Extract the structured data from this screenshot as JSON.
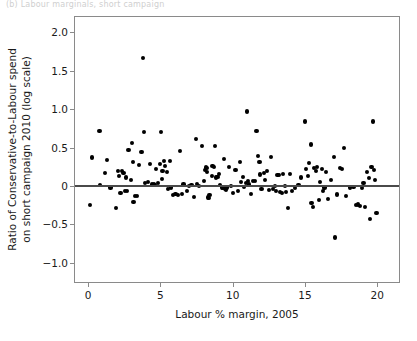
{
  "figure": {
    "top_strip_text": "(b) Labour marginals, short campaign",
    "background": "#ffffff",
    "point_color": "#000000",
    "axis_color": "#8a8a8a",
    "reference_line_color": "#4a4a4a"
  },
  "chart_data": {
    "type": "scatter",
    "title": "",
    "xlabel": "Labour % margin, 2005",
    "ylabel": "Ratio of Conservative-to-Labour spend on short campaign 2010 (log scale)",
    "ylabel_line1": "Ratio of Conservative-to-Labour spend",
    "ylabel_line2": "on short campaign 2010 (log scale)",
    "xlim": [
      -0.9,
      21.5
    ],
    "ylim": [
      -1.25,
      2.2
    ],
    "xticks": [
      0,
      5,
      10,
      15,
      20
    ],
    "xticklabels": [
      "0",
      "5",
      "10",
      "15",
      "20"
    ],
    "yticks": [
      2.0,
      1.5,
      1.0,
      0.5,
      0,
      -0.5,
      -1.0
    ],
    "yticklabels": [
      "2.0",
      "1.5",
      "1.0",
      "0.5",
      "0",
      "−0.5",
      "−1.0"
    ],
    "grid": false,
    "legend": null,
    "reference_lines": [
      {
        "axis": "y",
        "value": 0
      }
    ],
    "marker": "circle",
    "n_points": 163,
    "points": [
      [
        0.15,
        -0.25
      ],
      [
        0.25,
        0.37
      ],
      [
        0.8,
        0.72
      ],
      [
        0.85,
        0.01
      ],
      [
        1.15,
        0.17
      ],
      [
        1.3,
        0.34
      ],
      [
        1.55,
        -0.02
      ],
      [
        1.95,
        -0.29
      ],
      [
        2.05,
        0.19
      ],
      [
        2.15,
        0.13
      ],
      [
        2.25,
        -0.09
      ],
      [
        2.35,
        0.2
      ],
      [
        2.45,
        0.17
      ],
      [
        2.55,
        -0.07
      ],
      [
        2.6,
        0.11
      ],
      [
        2.7,
        -0.06
      ],
      [
        2.8,
        0.47
      ],
      [
        2.95,
        0.08
      ],
      [
        3.05,
        0.56
      ],
      [
        3.1,
        0.31
      ],
      [
        3.15,
        -0.21
      ],
      [
        3.25,
        -0.13
      ],
      [
        3.4,
        -0.13
      ],
      [
        3.5,
        0.27
      ],
      [
        3.7,
        0.44
      ],
      [
        3.8,
        1.67
      ],
      [
        3.85,
        0.7
      ],
      [
        3.95,
        0.04
      ],
      [
        4.15,
        0.05
      ],
      [
        4.3,
        0.29
      ],
      [
        4.4,
        0.02
      ],
      [
        4.55,
        0.03
      ],
      [
        4.65,
        0.01
      ],
      [
        4.7,
        0.22
      ],
      [
        4.85,
        0.04
      ],
      [
        4.95,
        0.29
      ],
      [
        5.05,
        0.7
      ],
      [
        5.1,
        0.09
      ],
      [
        5.15,
        0.19
      ],
      [
        5.25,
        0.33
      ],
      [
        5.35,
        0.26
      ],
      [
        5.45,
        0.18
      ],
      [
        5.55,
        -0.04
      ],
      [
        5.65,
        0.32
      ],
      [
        5.75,
        -0.02
      ],
      [
        5.85,
        -0.12
      ],
      [
        6.05,
        -0.1
      ],
      [
        6.2,
        -0.12
      ],
      [
        6.35,
        0.46
      ],
      [
        6.5,
        -0.1
      ],
      [
        6.6,
        0.02
      ],
      [
        6.85,
        -0.06
      ],
      [
        7.0,
        0.0
      ],
      [
        7.15,
        0.01
      ],
      [
        7.3,
        -0.14
      ],
      [
        7.45,
        0.61
      ],
      [
        7.55,
        0.03
      ],
      [
        7.7,
        0.0
      ],
      [
        7.9,
        0.52
      ],
      [
        8.0,
        0.07
      ],
      [
        8.1,
        0.21
      ],
      [
        8.15,
        0.24
      ],
      [
        8.2,
        0.23
      ],
      [
        8.25,
        0.18
      ],
      [
        8.3,
        -0.15
      ],
      [
        8.35,
        -0.16
      ],
      [
        8.4,
        -0.12
      ],
      [
        8.55,
        0.13
      ],
      [
        8.6,
        0.26
      ],
      [
        8.7,
        0.25
      ],
      [
        8.8,
        0.52
      ],
      [
        8.85,
        0.11
      ],
      [
        8.95,
        0.12
      ],
      [
        9.05,
        0.16
      ],
      [
        9.15,
        0.01
      ],
      [
        9.25,
        -0.02
      ],
      [
        9.35,
        -0.03
      ],
      [
        9.4,
        0.35
      ],
      [
        9.45,
        -0.04
      ],
      [
        9.5,
        -0.01
      ],
      [
        9.55,
        -0.05
      ],
      [
        9.6,
        -0.02
      ],
      [
        9.75,
        0.25
      ],
      [
        9.9,
        0.0
      ],
      [
        10.05,
        -0.09
      ],
      [
        10.2,
        0.21
      ],
      [
        10.35,
        -0.07
      ],
      [
        10.5,
        0.31
      ],
      [
        10.6,
        0.05
      ],
      [
        10.7,
        0.12
      ],
      [
        10.8,
        -0.01
      ],
      [
        10.9,
        0.04
      ],
      [
        11.0,
        0.97
      ],
      [
        11.05,
        0.07
      ],
      [
        11.15,
        0.02
      ],
      [
        11.25,
        -0.1
      ],
      [
        11.4,
        0.06
      ],
      [
        11.55,
        0.07
      ],
      [
        11.65,
        0.72
      ],
      [
        11.75,
        0.39
      ],
      [
        11.85,
        0.31
      ],
      [
        11.9,
        0.15
      ],
      [
        12.0,
        -0.04
      ],
      [
        12.15,
        0.17
      ],
      [
        12.25,
        0.08
      ],
      [
        12.35,
        0.19
      ],
      [
        12.5,
        -0.05
      ],
      [
        12.65,
        0.38
      ],
      [
        12.8,
        -0.04
      ],
      [
        12.9,
        0.0
      ],
      [
        13.0,
        -0.06
      ],
      [
        13.1,
        0.14
      ],
      [
        13.2,
        0.14
      ],
      [
        13.3,
        -0.08
      ],
      [
        13.4,
        -0.09
      ],
      [
        13.5,
        0.16
      ],
      [
        13.6,
        0.0
      ],
      [
        13.7,
        -0.08
      ],
      [
        13.8,
        -0.29
      ],
      [
        13.95,
        0.16
      ],
      [
        14.1,
        -0.07
      ],
      [
        14.3,
        -0.03
      ],
      [
        14.55,
        0.01
      ],
      [
        14.75,
        0.11
      ],
      [
        15.0,
        0.84
      ],
      [
        15.05,
        0.22
      ],
      [
        15.2,
        0.13
      ],
      [
        15.3,
        0.3
      ],
      [
        15.4,
        0.54
      ],
      [
        15.45,
        -0.22
      ],
      [
        15.55,
        -0.27
      ],
      [
        15.65,
        0.23
      ],
      [
        15.75,
        0.19
      ],
      [
        15.85,
        0.25
      ],
      [
        15.95,
        -0.18
      ],
      [
        16.05,
        0.05
      ],
      [
        16.15,
        0.22
      ],
      [
        16.25,
        -0.06
      ],
      [
        16.35,
        -0.02
      ],
      [
        16.45,
        0.18
      ],
      [
        16.6,
        -0.17
      ],
      [
        16.8,
        0.08
      ],
      [
        17.0,
        0.38
      ],
      [
        17.05,
        -0.67
      ],
      [
        17.2,
        -0.11
      ],
      [
        17.4,
        0.23
      ],
      [
        17.55,
        0.22
      ],
      [
        17.7,
        0.49
      ],
      [
        17.85,
        -0.13
      ],
      [
        18.1,
        -0.02
      ],
      [
        18.35,
        -0.01
      ],
      [
        18.55,
        -0.25
      ],
      [
        18.65,
        -0.24
      ],
      [
        18.8,
        -0.26
      ],
      [
        18.95,
        -0.03
      ],
      [
        19.05,
        0.04
      ],
      [
        19.15,
        -0.27
      ],
      [
        19.3,
        0.18
      ],
      [
        19.4,
        0.1
      ],
      [
        19.5,
        -0.43
      ],
      [
        19.6,
        0.25
      ],
      [
        19.7,
        0.84
      ],
      [
        19.75,
        0.21
      ],
      [
        19.85,
        0.08
      ],
      [
        19.95,
        -0.35
      ]
    ]
  }
}
